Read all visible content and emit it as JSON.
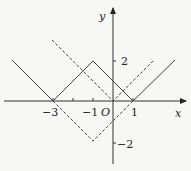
{
  "diagram": {
    "type": "function-graph",
    "axes": {
      "x_label": "x",
      "y_label": "y",
      "origin_label": "O",
      "x_ticks": [
        {
          "value": -3,
          "label": "−3"
        },
        {
          "value": -2,
          "label": ""
        },
        {
          "value": -1,
          "label": "−1"
        },
        {
          "value": 1,
          "label": "1"
        }
      ],
      "y_ticks": [
        {
          "value": 2,
          "label": "2"
        },
        {
          "value": -2,
          "label": "−2"
        }
      ]
    },
    "curves": [
      {
        "name": "solid-curve",
        "style": "solid",
        "expression": "y = ||x+1| − 2|",
        "points": [
          [
            -5.05,
            2.05
          ],
          [
            -3,
            0
          ],
          [
            -1,
            2
          ],
          [
            1,
            0
          ],
          [
            3.1,
            2.05
          ]
        ]
      },
      {
        "name": "dashed-v-lower",
        "style": "dashed",
        "expression": "y = |x+1| − 2",
        "points": [
          [
            -3,
            0
          ],
          [
            -1,
            -2
          ],
          [
            1,
            0
          ]
        ]
      },
      {
        "name": "dashed-v-upper",
        "style": "dashed",
        "expression": "y = |x|",
        "points": [
          [
            -3.05,
            3.05
          ],
          [
            0,
            0
          ],
          [
            2.05,
            2.05
          ]
        ]
      }
    ],
    "colors": {
      "stroke": "#333333",
      "background": "#f7f7f5"
    }
  }
}
